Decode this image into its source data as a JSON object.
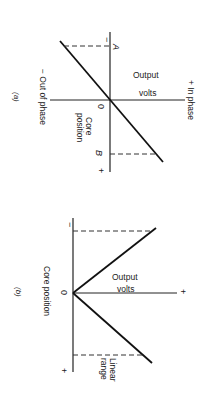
{
  "figure_a": {
    "label": "(a)",
    "output_axis_label_line1": "Output",
    "output_axis_label_line2": "volts",
    "in_phase_label": "+ In phase",
    "out_of_phase_label": "− Out of phase",
    "core_axis_label_line1": "Core",
    "core_axis_label_line2": "position",
    "origin_label": "0",
    "minus_label": "−",
    "plus_label": "+",
    "point_a_label": "A",
    "point_b_label": "B"
  },
  "figure_b": {
    "label": "(b)",
    "output_axis_label_line1": "Output",
    "output_axis_label_line2": "volts",
    "plus_label": "+",
    "core_axis_label": "Core position",
    "origin_label": "0",
    "minus_label": "−",
    "core_plus_label": "+",
    "linear_range_line1": "Linear",
    "linear_range_line2": "range"
  }
}
